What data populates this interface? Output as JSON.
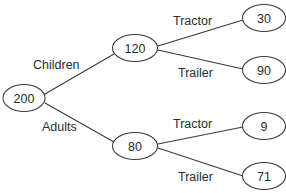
{
  "diagram": {
    "type": "tree",
    "background_color": "#ffffff",
    "stroke_color": "#3a3a3a",
    "text_color": "#2b2b2b",
    "nodes": [
      {
        "id": "root",
        "value": "200",
        "cx": 24,
        "cy": 98,
        "rx": 21,
        "ry": 13.5,
        "level": 0
      },
      {
        "id": "children",
        "value": "120",
        "cx": 135,
        "cy": 48,
        "rx": 22.5,
        "ry": 13.5,
        "level": 1
      },
      {
        "id": "adults",
        "value": "80",
        "cx": 135,
        "cy": 146,
        "rx": 22.5,
        "ry": 13.5,
        "level": 1
      },
      {
        "id": "child-tractor",
        "value": "30",
        "cx": 264,
        "cy": 18,
        "rx": 21.5,
        "ry": 13.5,
        "level": 2
      },
      {
        "id": "child-trailer",
        "value": "90",
        "cx": 264,
        "cy": 70,
        "rx": 21.5,
        "ry": 13.5,
        "level": 2
      },
      {
        "id": "adult-tractor",
        "value": "9",
        "cx": 264,
        "cy": 126,
        "rx": 21.5,
        "ry": 13.5,
        "level": 2
      },
      {
        "id": "adult-trailer",
        "value": "71",
        "cx": 264,
        "cy": 176,
        "rx": 21.5,
        "ry": 13.5,
        "level": 2
      }
    ],
    "edges": [
      {
        "id": "edge-root-children",
        "from": "root",
        "to": "children",
        "x1": 45,
        "y1": 94,
        "x2": 114,
        "y2": 54
      },
      {
        "id": "edge-root-adults",
        "from": "root",
        "to": "adults",
        "x1": 45,
        "y1": 103,
        "x2": 114,
        "y2": 142
      },
      {
        "id": "edge-children-tractor",
        "from": "children",
        "to": "child-tractor",
        "x1": 158,
        "y1": 46,
        "x2": 243,
        "y2": 20
      },
      {
        "id": "edge-children-trailer",
        "from": "children",
        "to": "child-trailer",
        "x1": 158,
        "y1": 50,
        "x2": 243,
        "y2": 69
      },
      {
        "id": "edge-adults-tractor",
        "from": "adults",
        "to": "adult-tractor",
        "x1": 158,
        "y1": 144,
        "x2": 243,
        "y2": 127
      },
      {
        "id": "edge-adults-trailer",
        "from": "adults",
        "to": "adult-trailer",
        "x1": 158,
        "y1": 148,
        "x2": 243,
        "y2": 176
      }
    ],
    "edge_labels": [
      {
        "id": "label-children",
        "text": "Children",
        "x": 33,
        "y": 65,
        "anchor": "start"
      },
      {
        "id": "label-adults",
        "text": "Adults",
        "x": 42,
        "y": 127,
        "anchor": "start"
      },
      {
        "id": "label-tractor-child",
        "text": "Tractor",
        "x": 173,
        "y": 21,
        "anchor": "start"
      },
      {
        "id": "label-trailer-child",
        "text": "Trailer",
        "x": 178,
        "y": 73,
        "anchor": "start"
      },
      {
        "id": "label-tractor-adult",
        "text": "Tractor",
        "x": 173,
        "y": 124,
        "anchor": "start"
      },
      {
        "id": "label-trailer-adult",
        "text": "Trailer",
        "x": 178,
        "y": 177,
        "anchor": "start"
      }
    ]
  }
}
